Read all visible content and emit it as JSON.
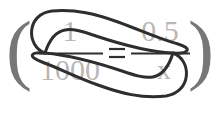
{
  "figure": {
    "colors": {
      "equation_text": "#b8b8b8",
      "annotation_line": "#2e2e2e",
      "paren": "#777777",
      "background": "#ffffff"
    }
  },
  "equation": {
    "left_paren": "(",
    "right_paren": ")",
    "equals": "=",
    "left_fraction": {
      "numerator": "1",
      "denominator": "1000"
    },
    "right_fraction": {
      "numerator": "0.5",
      "denominator": "x"
    }
  },
  "annotations": {
    "upper_loop_label": "cross-multiply-loop-upper",
    "lower_loop_label": "cross-multiply-loop-lower",
    "left_crossing_label": "crossing-point-left",
    "right_crossing_label": "crossing-point-right"
  }
}
